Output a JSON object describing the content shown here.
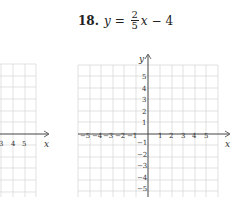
{
  "problem": {
    "number": "18.",
    "lhs": "y",
    "equals": "=",
    "numerator": "2",
    "denominator": "5",
    "rest_var": "x",
    "rest_op": "−",
    "rest_const": "4"
  },
  "left_grid": {
    "x_tick_labels": [
      "3",
      "4",
      "5"
    ],
    "x_axis_label": "x"
  },
  "right_grid": {
    "x_axis_label": "x",
    "y_axis_label": "y",
    "x_tick_labels_neg": [
      "−5",
      "−4",
      "−3",
      "−2",
      "−1"
    ],
    "x_tick_labels_pos": [
      "1",
      "2",
      "3",
      "4",
      "5"
    ],
    "y_tick_labels_pos": [
      "5",
      "4",
      "3",
      "2",
      "1"
    ],
    "y_tick_labels_neg": [
      "−1",
      "−2",
      "−3",
      "−4",
      "−5"
    ],
    "grid_color": "#d4d4d4",
    "axis_color": "#444444"
  }
}
